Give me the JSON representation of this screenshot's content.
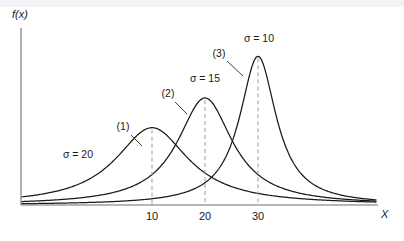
{
  "figure": {
    "background_color": "#ffffff",
    "top_band_color": "#f2f3f5",
    "axis_color": "#6b6f73",
    "curve_color": "#1a1a1a",
    "dash_color": "#9a9da1"
  },
  "chart_data": {
    "type": "line",
    "title": "",
    "subtitle": "",
    "xlabel": "X",
    "ylabel": "f(x)",
    "grid": false,
    "legend_position": "inline-annotations",
    "xlim": [
      0,
      40
    ],
    "ylim": [
      0,
      1
    ],
    "xticks": [
      10,
      20,
      30
    ],
    "xtick_labels": [
      "10",
      "20",
      "30"
    ],
    "yticks": [],
    "ytick_labels": [],
    "series": [
      {
        "name": "(1)",
        "id_label": "(1)",
        "sigma_label": "σ = 20",
        "sigma": 20,
        "mean": 10,
        "peak_height": 0.52,
        "id_label_pos": [
          123,
          130
        ],
        "sigma_label_pos": [
          78,
          158
        ],
        "leader": [
          [
            131,
            135
          ],
          [
            142,
            146
          ]
        ]
      },
      {
        "name": "(2)",
        "id_label": "(2)",
        "sigma_label": "σ = 15",
        "sigma": 15,
        "mean": 20,
        "peak_height": 0.72,
        "id_label_pos": [
          168,
          97
        ],
        "sigma_label_pos": [
          205,
          82
        ],
        "leader": [
          [
            175,
            102
          ],
          [
            187,
            114
          ]
        ]
      },
      {
        "name": "(3)",
        "id_label": "(3)",
        "sigma_label": "σ = 10",
        "sigma": 10,
        "mean": 30,
        "peak_height": 1.0,
        "id_label_pos": [
          219,
          57
        ],
        "sigma_label_pos": [
          259,
          42
        ],
        "leader": [
          [
            227,
            61
          ],
          [
            243,
            76
          ]
        ]
      }
    ],
    "axes_pixels": {
      "origin": [
        21,
        205
      ],
      "x_axis_end": [
        378,
        205
      ],
      "y_axis_top": [
        21,
        28
      ],
      "x_pixel_at_10": 152,
      "x_pixel_at_20": 205,
      "x_pixel_at_30": 258
    }
  }
}
